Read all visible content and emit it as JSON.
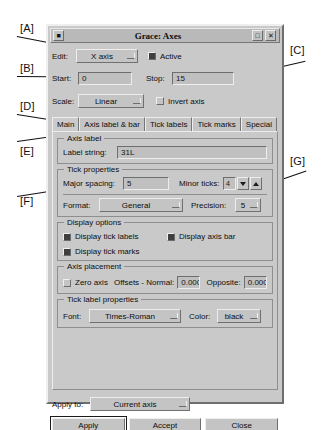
{
  "window": {
    "title": "Grace: Axes",
    "titlebar_buttons": [
      "menu-box",
      "maximize",
      "close"
    ]
  },
  "edit_row": {
    "label": "Edit:",
    "axis_value": "X axis",
    "active_label": "Active",
    "active_checked": true
  },
  "range_row": {
    "start_label": "Start:",
    "start_value": "0",
    "stop_label": "Stop:",
    "stop_value": "15"
  },
  "scale_row": {
    "scale_label": "Scale:",
    "scale_value": "Linear",
    "invert_label": "Invert axis",
    "invert_checked": false
  },
  "tabs": [
    {
      "label": "Main",
      "active": true
    },
    {
      "label": "Axis label & bar",
      "active": false
    },
    {
      "label": "Tick labels",
      "active": false
    },
    {
      "label": "Tick marks",
      "active": false
    },
    {
      "label": "Special",
      "active": false
    }
  ],
  "axis_label_group": {
    "title": "Axis label",
    "label_string_label": "Label string:",
    "label_string_value": "31L"
  },
  "tick_properties_group": {
    "title": "Tick properties",
    "major_spacing_label": "Major spacing:",
    "major_spacing_value": "5",
    "minor_ticks_label": "Minor ticks:",
    "minor_ticks_value": "4",
    "format_label": "Format:",
    "format_value": "General",
    "precision_label": "Precision:",
    "precision_value": "5"
  },
  "display_options_group": {
    "title": "Display options",
    "items": [
      {
        "label": "Display tick labels",
        "checked": true
      },
      {
        "label": "Display axis bar",
        "checked": true
      },
      {
        "label": "Display tick marks",
        "checked": true
      }
    ]
  },
  "axis_placement_group": {
    "title": "Axis placement",
    "zero_axis_label": "Zero axis",
    "zero_axis_checked": false,
    "offsets_label": "Offsets - Normal:",
    "normal_value": "0.0000",
    "opposite_label": "Opposite:",
    "opposite_value": "0.0000"
  },
  "tick_label_properties_group": {
    "title": "Tick label properties",
    "font_label": "Font:",
    "font_value": "Times-Roman",
    "color_label": "Color:",
    "color_value": "black"
  },
  "apply_to": {
    "label": "Apply to:",
    "value": "Current axis"
  },
  "buttons": {
    "apply": "Apply",
    "accept": "Accept",
    "close": "Close"
  },
  "annotations": [
    {
      "id": "A",
      "label": "[A]"
    },
    {
      "id": "B",
      "label": "[B]"
    },
    {
      "id": "C",
      "label": "[C]"
    },
    {
      "id": "D",
      "label": "[D]"
    },
    {
      "id": "E",
      "label": "[E]"
    },
    {
      "id": "F",
      "label": "[F]"
    },
    {
      "id": "G",
      "label": "[G]"
    }
  ]
}
